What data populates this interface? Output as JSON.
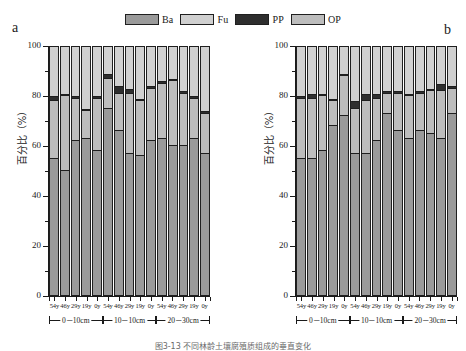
{
  "figure": {
    "panel_a_letter": "a",
    "panel_b_letter": "b",
    "caption": "图3-13 不同林龄土壤腐殖质组成的垂直变化"
  },
  "legend": {
    "position": "top-center",
    "entries": [
      {
        "label": "Ba",
        "color": "#9a9a9a"
      },
      {
        "label": "Fu",
        "color": "#d0d0d0"
      },
      {
        "label": "PP",
        "color": "#2e2e2e"
      },
      {
        "label": "OP",
        "color": "#bdbdbd"
      }
    ]
  },
  "axes": {
    "ylabel": "百分比（%）",
    "yticks": [
      0,
      20,
      40,
      60,
      80,
      100
    ],
    "ylim": [
      0,
      100
    ],
    "xgroups": [
      {
        "label": "0－10cm"
      },
      {
        "label": "10－10cm"
      },
      {
        "label": "20－30cm"
      }
    ],
    "xticklabels": [
      "54y",
      "46y",
      "29y",
      "19y",
      "0y",
      "54y",
      "46y",
      "29y",
      "19y",
      "0y",
      "54y",
      "46y",
      "29y",
      "19y",
      "0y"
    ]
  },
  "chart_data": [
    {
      "type": "bar",
      "id": "panel-a",
      "stacked": true,
      "title": "a",
      "xlabel": "",
      "ylabel": "百分比（%）",
      "ylim": [
        0,
        100
      ],
      "grid": false,
      "categories": [
        "54y",
        "46y",
        "29y",
        "19y",
        "0y",
        "54y",
        "46y",
        "29y",
        "19y",
        "0y",
        "54y",
        "46y",
        "29y",
        "19y",
        "0y"
      ],
      "depth_groups": [
        "0－10cm",
        "0－10cm",
        "0－10cm",
        "0－10cm",
        "0－10cm",
        "10－10cm",
        "10－10cm",
        "10－10cm",
        "10－10cm",
        "10－10cm",
        "20－30cm",
        "20－30cm",
        "20－30cm",
        "20－30cm",
        "20－30cm"
      ],
      "series": [
        {
          "name": "Ba",
          "color": "#9a9a9a",
          "values": [
            55,
            50,
            62,
            63,
            58,
            75,
            66,
            57,
            56,
            62,
            63,
            60,
            60,
            63,
            57
          ]
        },
        {
          "name": "OP",
          "color": "#bdbdbd",
          "values": [
            23,
            30,
            17,
            11,
            21,
            12,
            15,
            24,
            22,
            21,
            22,
            26,
            21,
            16,
            16
          ]
        },
        {
          "name": "PP",
          "color": "#2e2e2e",
          "values": [
            2,
            1,
            1,
            1,
            1,
            2,
            3,
            2,
            1,
            1,
            1,
            1,
            1,
            1,
            1
          ]
        },
        {
          "name": "Fu",
          "color": "#d0d0d0",
          "values": [
            20,
            19,
            20,
            25,
            20,
            11,
            16,
            17,
            21,
            16,
            14,
            13,
            18,
            20,
            26
          ]
        }
      ]
    },
    {
      "type": "bar",
      "id": "panel-b",
      "stacked": true,
      "title": "b",
      "xlabel": "",
      "ylabel": "百分比（%）",
      "ylim": [
        0,
        100
      ],
      "grid": false,
      "categories": [
        "54y",
        "46y",
        "29y",
        "19y",
        "0y",
        "54y",
        "46y",
        "29y",
        "19y",
        "0y",
        "54y",
        "46y",
        "29y",
        "19y",
        "0y"
      ],
      "depth_groups": [
        "0－10cm",
        "0－10cm",
        "0－10cm",
        "0－10cm",
        "0－10cm",
        "10－10cm",
        "10－10cm",
        "10－10cm",
        "10－10cm",
        "10－10cm",
        "20－30cm",
        "20－30cm",
        "20－30cm",
        "20－30cm",
        "20－30cm"
      ],
      "series": [
        {
          "name": "Ba",
          "color": "#9a9a9a",
          "values": [
            55,
            55,
            58,
            68,
            72,
            57,
            57,
            62,
            73,
            66,
            63,
            66,
            65,
            63,
            73
          ]
        },
        {
          "name": "OP",
          "color": "#bdbdbd",
          "values": [
            24,
            24,
            22,
            10,
            16,
            18,
            21,
            17,
            8,
            15,
            17,
            15,
            17,
            19,
            10
          ]
        },
        {
          "name": "PP",
          "color": "#2e2e2e",
          "values": [
            1,
            2,
            1,
            1,
            1,
            3,
            3,
            2,
            1,
            1,
            1,
            1,
            1,
            3,
            1
          ]
        },
        {
          "name": "Fu",
          "color": "#d0d0d0",
          "values": [
            20,
            19,
            19,
            21,
            11,
            22,
            19,
            19,
            18,
            18,
            19,
            18,
            17,
            15,
            16
          ]
        }
      ]
    }
  ]
}
